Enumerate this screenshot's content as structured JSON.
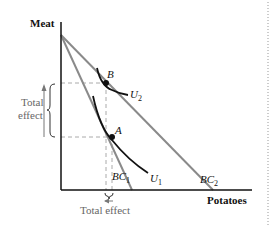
{
  "diagram": {
    "y_axis_label": "Meat",
    "x_axis_label": "Potatoes",
    "points": {
      "A": "A",
      "B": "B"
    },
    "curves": {
      "U1": {
        "base": "U",
        "sub": "1"
      },
      "U2": {
        "base": "U",
        "sub": "2"
      },
      "BC1": {
        "base": "BC",
        "sub": "1"
      },
      "BC2": {
        "base": "BC",
        "sub": "2"
      }
    },
    "vertical_effect_label_line1": "Total",
    "vertical_effect_label_line2": "effect",
    "horizontal_effect_label": "Total effect",
    "colors": {
      "axis": "#111111",
      "budget_line": "#8a8a8a",
      "indifference_curve": "#111111",
      "dashed_guides": "#aaaaaa",
      "annotation": "#666666",
      "border_dots": "#999999"
    }
  }
}
